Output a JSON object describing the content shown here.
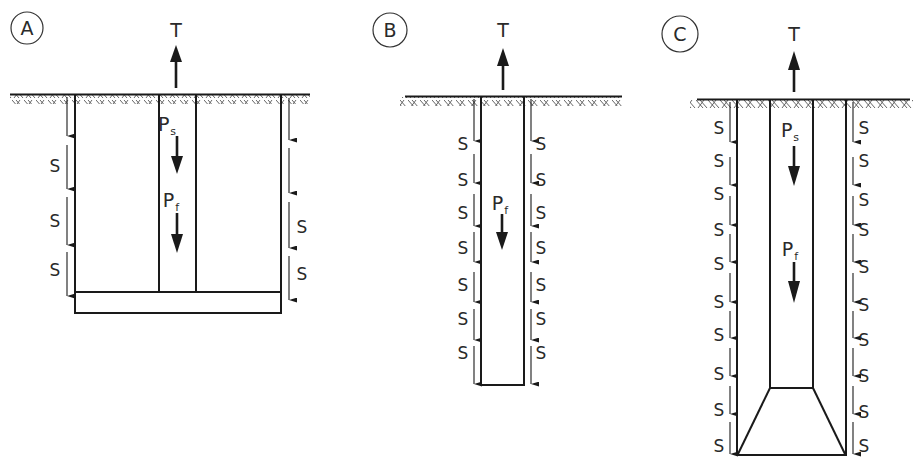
{
  "figure": {
    "panels": [
      {
        "id": "A",
        "badge": "A",
        "top_force": "T",
        "shaft_loads": [
          {
            "main": "P",
            "sub": "s"
          },
          {
            "main": "P",
            "sub": "f"
          }
        ],
        "side_label": "S",
        "left_s_count": 3,
        "right_s_count": 2,
        "description": "Pile with enlarged base plate; central shaft inside outer cylinder"
      },
      {
        "id": "B",
        "badge": "B",
        "top_force": "T",
        "shaft_loads": [
          {
            "main": "P",
            "sub": "f"
          }
        ],
        "side_label": "S",
        "left_s_count": 7,
        "right_s_count": 7,
        "description": "Straight shaft pile"
      },
      {
        "id": "C",
        "badge": "C",
        "top_force": "T",
        "shaft_loads": [
          {
            "main": "P",
            "sub": "s"
          },
          {
            "main": "P",
            "sub": "f"
          }
        ],
        "side_label": "S",
        "left_s_count": 10,
        "right_s_count": 10,
        "description": "Belled pile; inner shaft with trapezoidal base inside outer cylinder"
      }
    ]
  },
  "colors": {
    "line": "#1a1a1a",
    "text": "#2a2a2a",
    "background": "#ffffff"
  }
}
